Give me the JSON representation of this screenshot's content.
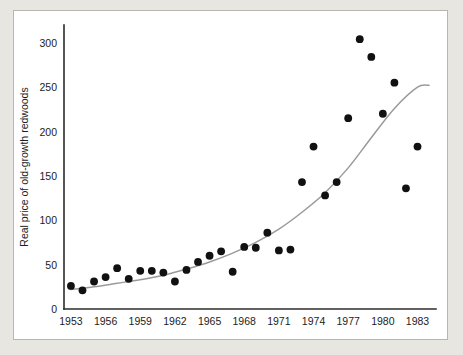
{
  "chart_data": {
    "type": "scatter",
    "title": "",
    "xlabel": "",
    "ylabel": "Real price of old-growth redwoods",
    "xlim": [
      1952.4,
      1984.6
    ],
    "ylim": [
      0,
      320
    ],
    "xticks": [
      1953,
      1956,
      1959,
      1962,
      1965,
      1968,
      1971,
      1974,
      1977,
      1980,
      1983
    ],
    "yticks": [
      0,
      50,
      100,
      150,
      200,
      250,
      300
    ],
    "grid": false,
    "legend": null,
    "marker": "filled-circle",
    "marker_color": "#111111",
    "x": [
      1953,
      1954,
      1955,
      1956,
      1957,
      1958,
      1959,
      1960,
      1961,
      1962,
      1963,
      1964,
      1965,
      1966,
      1967,
      1968,
      1969,
      1970,
      1971,
      1972,
      1973,
      1974,
      1975,
      1976,
      1977,
      1978,
      1979,
      1980,
      1981,
      1982,
      1983,
      1984
    ],
    "y": [
      26,
      21,
      31,
      36,
      46,
      34,
      43,
      43,
      41,
      31,
      44,
      53,
      60,
      65,
      42,
      70,
      69,
      86,
      66,
      67,
      143,
      183,
      128,
      143,
      215,
      304,
      284,
      220,
      255,
      136,
      183
    ],
    "series": [
      {
        "name": "Observed real price",
        "type": "scatter",
        "points": [
          {
            "x": 1953,
            "y": 26
          },
          {
            "x": 1954,
            "y": 21
          },
          {
            "x": 1955,
            "y": 31
          },
          {
            "x": 1956,
            "y": 36
          },
          {
            "x": 1957,
            "y": 46
          },
          {
            "x": 1958,
            "y": 34
          },
          {
            "x": 1959,
            "y": 43
          },
          {
            "x": 1960,
            "y": 43
          },
          {
            "x": 1961,
            "y": 41
          },
          {
            "x": 1962,
            "y": 31
          },
          {
            "x": 1963,
            "y": 44
          },
          {
            "x": 1964,
            "y": 53
          },
          {
            "x": 1965,
            "y": 60
          },
          {
            "x": 1966,
            "y": 65
          },
          {
            "x": 1967,
            "y": 42
          },
          {
            "x": 1968,
            "y": 70
          },
          {
            "x": 1969,
            "y": 69
          },
          {
            "x": 1970,
            "y": 86
          },
          {
            "x": 1971,
            "y": 66
          },
          {
            "x": 1972,
            "y": 67
          },
          {
            "x": 1973,
            "y": 143
          },
          {
            "x": 1974,
            "y": 183
          },
          {
            "x": 1975,
            "y": 128
          },
          {
            "x": 1976,
            "y": 143
          },
          {
            "x": 1977,
            "y": 215
          },
          {
            "x": 1978,
            "y": 304
          },
          {
            "x": 1979,
            "y": 284
          },
          {
            "x": 1980,
            "y": 220
          },
          {
            "x": 1981,
            "y": 255
          },
          {
            "x": 1982,
            "y": 136
          },
          {
            "x": 1983,
            "y": 183
          }
        ]
      },
      {
        "name": "Exponential trend",
        "type": "line",
        "color": "#9a9a9a",
        "points": [
          {
            "x": 1953,
            "y": 22
          },
          {
            "x": 1955,
            "y": 25
          },
          {
            "x": 1957,
            "y": 29
          },
          {
            "x": 1959,
            "y": 33
          },
          {
            "x": 1961,
            "y": 38
          },
          {
            "x": 1963,
            "y": 45
          },
          {
            "x": 1965,
            "y": 53
          },
          {
            "x": 1967,
            "y": 63
          },
          {
            "x": 1969,
            "y": 75
          },
          {
            "x": 1971,
            "y": 90
          },
          {
            "x": 1973,
            "y": 109
          },
          {
            "x": 1975,
            "y": 131
          },
          {
            "x": 1977,
            "y": 159
          },
          {
            "x": 1979,
            "y": 193
          },
          {
            "x": 1981,
            "y": 226
          },
          {
            "x": 1983,
            "y": 250
          },
          {
            "x": 1984,
            "y": 252
          }
        ]
      }
    ]
  },
  "axes": {
    "y_title": "Real price of old-growth redwoods",
    "y_tick_labels": [
      "0",
      "50",
      "100",
      "150",
      "200",
      "250",
      "300"
    ],
    "x_tick_labels": [
      "1953",
      "1956",
      "1959",
      "1962",
      "1965",
      "1968",
      "1971",
      "1974",
      "1977",
      "1980",
      "1983"
    ]
  },
  "colors": {
    "page_background": "#e8e6e1",
    "panel_background": "#ffffff",
    "panel_border": "#b9b6b0",
    "axis": "#2b2b2b",
    "marker": "#111111",
    "trend_line": "#9a9a9a",
    "text": "#1c1c1c"
  }
}
